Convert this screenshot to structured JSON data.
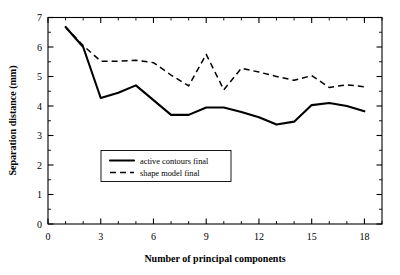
{
  "chart_data": {
    "type": "line",
    "title": "",
    "xlabel": "Number of principal components",
    "ylabel": "Separation distance (mm)",
    "xlim": [
      0,
      19
    ],
    "ylim": [
      0,
      7
    ],
    "grid": false,
    "legend_position": "center-left",
    "x_major_ticks": [
      0,
      3,
      6,
      9,
      12,
      15,
      18
    ],
    "x_tick_labels": [
      "0",
      "3",
      "6",
      "9",
      "12",
      "15",
      "18"
    ],
    "x_minor_interval": 1,
    "y_major_ticks": [
      0,
      1,
      2,
      3,
      4,
      5,
      6,
      7
    ],
    "y_tick_labels": [
      "0",
      "1",
      "2",
      "3",
      "4",
      "5",
      "6",
      "7"
    ],
    "y_minor_interval": 0.5,
    "x": [
      1,
      2,
      3,
      4,
      5,
      6,
      7,
      8,
      9,
      10,
      11,
      12,
      13,
      14,
      15,
      16,
      17,
      18
    ],
    "series": [
      {
        "name": "active contours final",
        "style": "solid",
        "color": "#000000",
        "values": [
          6.68,
          6.0,
          4.27,
          4.45,
          4.7,
          4.2,
          3.7,
          3.7,
          3.95,
          3.95,
          3.8,
          3.62,
          3.37,
          3.47,
          4.03,
          4.1,
          4.0,
          3.82
        ]
      },
      {
        "name": "shape model final",
        "style": "dashed",
        "color": "#000000",
        "values": [
          6.68,
          6.05,
          5.52,
          5.52,
          5.55,
          5.47,
          5.05,
          4.68,
          5.75,
          4.55,
          5.28,
          5.15,
          5.0,
          4.87,
          5.03,
          4.63,
          4.72,
          4.65
        ]
      }
    ]
  },
  "legend": {
    "entries": [
      {
        "label": "active contours final",
        "style": "solid"
      },
      {
        "label": "shape model final",
        "style": "dashed"
      }
    ]
  }
}
